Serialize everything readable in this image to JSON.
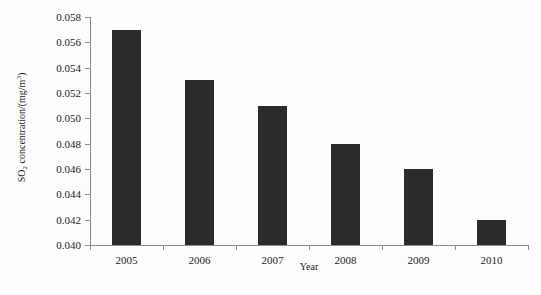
{
  "chart_data": {
    "type": "bar",
    "title": "",
    "subtitle": "",
    "xlabel": "Year",
    "ylabel": "SO2 concentration/(mg/m3)",
    "ylabel_parts": {
      "prefix": "SO",
      "sub": "2",
      "middle": " concentration/(mg/m",
      "sup": "3",
      "suffix": ")"
    },
    "categories": [
      "2005",
      "2006",
      "2007",
      "2008",
      "2009",
      "2010"
    ],
    "values": [
      0.057,
      0.053,
      0.051,
      0.048,
      0.046,
      0.042
    ],
    "ylim": [
      0.04,
      0.058
    ],
    "ytick_values": [
      0.04,
      0.042,
      0.044,
      0.046,
      0.048,
      0.05,
      0.052,
      0.054,
      0.056,
      0.058
    ],
    "ytick_labels": [
      "0.040",
      "0.042",
      "0.044",
      "0.046",
      "0.048",
      "0.050",
      "0.052",
      "0.054",
      "0.056",
      "0.058"
    ],
    "grid": false,
    "legend": false,
    "legend_position": "none",
    "bar_color": "#2b2b2b",
    "axis_color": "#8d8d8d",
    "background_color": "#fdfdfd",
    "series": [
      {
        "name": "SO2 concentration",
        "values": [
          0.057,
          0.053,
          0.051,
          0.048,
          0.046,
          0.042
        ]
      }
    ]
  }
}
